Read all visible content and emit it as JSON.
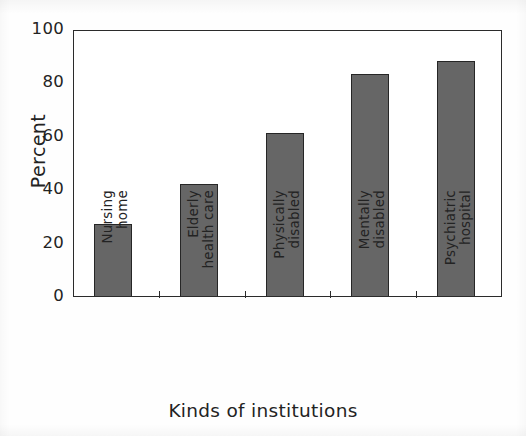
{
  "chart_data": {
    "type": "bar",
    "title": "",
    "xlabel": "Kinds of institutions",
    "ylabel": "Percent",
    "categories": [
      "Nursing home",
      "Elderly health care",
      "Physically disabled",
      "Mentally disabled",
      "Psychiatric hospital"
    ],
    "category_lines": [
      [
        "Nursing",
        "home"
      ],
      [
        "Elderly",
        "health care"
      ],
      [
        "Physically",
        "disabled"
      ],
      [
        "Mentally",
        "disabled"
      ],
      [
        "Psychiatric",
        "hospital"
      ]
    ],
    "values": [
      27,
      42,
      61,
      83,
      88
    ],
    "ylim": [
      0,
      100
    ],
    "ytick_labels": [
      "0",
      "20",
      "40",
      "60",
      "80",
      "100"
    ],
    "ytick_values": [
      0,
      20,
      40,
      60,
      80,
      100
    ],
    "grid": false,
    "legend": null,
    "bar_fill_color": "#666666",
    "bar_edge_color": "#262626",
    "axis_color": "#2b2b2b",
    "background_color": "#ffffff"
  }
}
